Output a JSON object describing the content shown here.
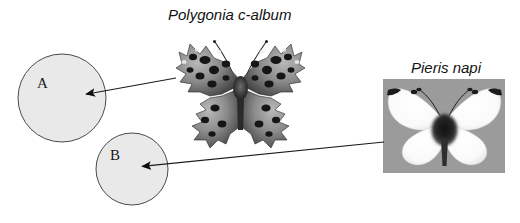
{
  "figure": {
    "background_color": "#ffffff",
    "width": 520,
    "height": 223,
    "labels": {
      "polygonia_title": "Polygonia c-album",
      "pieris_title": "Pieris napi",
      "circle_a": "A",
      "circle_b": "B"
    },
    "circles": [
      {
        "id": "a",
        "label": "A",
        "cx": 62,
        "cy": 98,
        "r": 44,
        "fill_color": "#e9e9e9",
        "stroke_color": "#4a4a4a"
      },
      {
        "id": "b",
        "label": "B",
        "cx": 132,
        "cy": 169,
        "r": 36,
        "fill_color": "#e9e9e9",
        "stroke_color": "#4a4a4a"
      }
    ],
    "arrows": [
      {
        "id": "polygonia-to-a",
        "from": "Polygonia c-album",
        "to": "A",
        "x1": 176,
        "y1": 78,
        "x2": 81,
        "y2": 95,
        "color": "#1a1a1a"
      },
      {
        "id": "pieris-to-b",
        "from": "Pieris napi",
        "to": "B",
        "x1": 384,
        "y1": 142,
        "x2": 137,
        "y2": 167,
        "color": "#1a1a1a"
      }
    ],
    "photos": [
      {
        "id": "polygonia-photo",
        "species": "Polygonia c-album",
        "common_description": "comma butterfly, dark mottled jagged wings",
        "background_color": "#ffffff",
        "x": 175,
        "y": 32,
        "width": 132,
        "height": 116
      },
      {
        "id": "pieris-photo",
        "species": "Pieris napi",
        "common_description": "green-veined white butterfly, pale wings",
        "background_color": "#9b9b9b",
        "x": 383,
        "y": 79,
        "width": 122,
        "height": 94
      }
    ]
  }
}
